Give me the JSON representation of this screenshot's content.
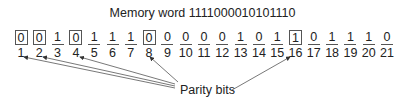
{
  "title": "Memory word 1111000010101110",
  "bits": [
    {
      "pos": "1",
      "value": "0",
      "parity": true
    },
    {
      "pos": "2",
      "value": "0",
      "parity": true
    },
    {
      "pos": "3",
      "value": "1",
      "parity": false
    },
    {
      "pos": "4",
      "value": "0",
      "parity": true
    },
    {
      "pos": "5",
      "value": "1",
      "parity": false
    },
    {
      "pos": "6",
      "value": "1",
      "parity": false
    },
    {
      "pos": "7",
      "value": "1",
      "parity": false
    },
    {
      "pos": "8",
      "value": "0",
      "parity": true
    },
    {
      "pos": "9",
      "value": "0",
      "parity": false
    },
    {
      "pos": "10",
      "value": "0",
      "parity": false
    },
    {
      "pos": "11",
      "value": "0",
      "parity": false
    },
    {
      "pos": "12",
      "value": "0",
      "parity": false
    },
    {
      "pos": "13",
      "value": "1",
      "parity": false
    },
    {
      "pos": "14",
      "value": "0",
      "parity": false
    },
    {
      "pos": "15",
      "value": "1",
      "parity": false
    },
    {
      "pos": "16",
      "value": "1",
      "parity": true
    },
    {
      "pos": "17",
      "value": "0",
      "parity": false
    },
    {
      "pos": "18",
      "value": "1",
      "parity": false
    },
    {
      "pos": "19",
      "value": "1",
      "parity": false
    },
    {
      "pos": "20",
      "value": "1",
      "parity": false
    },
    {
      "pos": "21",
      "value": "0",
      "parity": false
    }
  ],
  "annotation": "Parity bits"
}
